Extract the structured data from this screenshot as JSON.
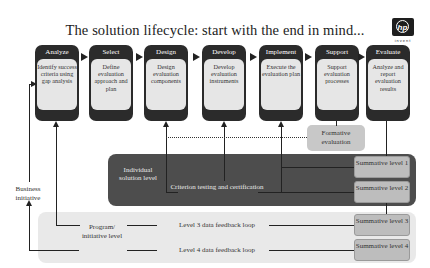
{
  "title": "The solution lifecycle: start with the end in mind...",
  "logo": {
    "mark": "hp",
    "tagline": "invent",
    "icon": "hp-logo-icon"
  },
  "phases": [
    {
      "name": "Analyze",
      "description": "Identify success criteria using gap analysis"
    },
    {
      "name": "Select",
      "description": "Define evaluation approach and plan"
    },
    {
      "name": "Design",
      "description": "Design evaluation components"
    },
    {
      "name": "Develop",
      "description": "Develop evaluation instruments"
    },
    {
      "name": "Implement",
      "description": "Execute the evaluation plan"
    },
    {
      "name": "Support",
      "description": "Support evaluation processes"
    },
    {
      "name": "Evaluate",
      "description": "Analyze and report evaluation results"
    }
  ],
  "formative": "Formative evaluation",
  "individual_level": {
    "label": "Individual solution level",
    "criterion": "Criterion testing and certification"
  },
  "program_level": {
    "label": "Program/ initiative level",
    "loop3": "Level 3 data feedback loop",
    "loop4": "Level 4 data feedback loop"
  },
  "business_initiative": "Business initiative",
  "summative": [
    {
      "label": "Summative level 1"
    },
    {
      "label": "Summative level 2"
    },
    {
      "label": "Summative level 3"
    },
    {
      "label": "Summative level 4"
    }
  ],
  "colors": {
    "phase_dark": "#2b2b2b",
    "phase_body": "#e6e6e6",
    "individual_panel": "#4d4d4d",
    "program_panel": "#e9e9e9",
    "summative_box": "#bdbdbd",
    "formative_box": "#c8c8c8"
  }
}
